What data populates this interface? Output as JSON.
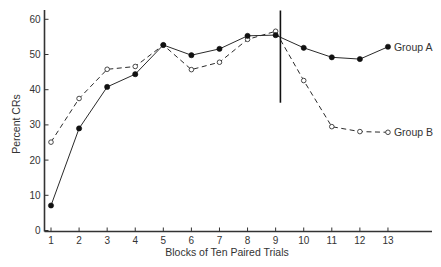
{
  "chart_data": {
    "type": "line",
    "title": "",
    "xlabel": "Blocks of Ten Paired Trials",
    "ylabel": "Percent CRs",
    "x": [
      1,
      2,
      3,
      4,
      5,
      6,
      7,
      8,
      9,
      10,
      11,
      12,
      13
    ],
    "xticks": [
      "1",
      "2",
      "3",
      "4",
      "5",
      "6",
      "7",
      "8",
      "9",
      "10",
      "11",
      "12",
      "13"
    ],
    "yticks": [
      "0",
      "10",
      "20",
      "30",
      "40",
      "50",
      "60"
    ],
    "ylim": [
      0,
      60
    ],
    "xlim": [
      0.7,
      14.6
    ],
    "grid": false,
    "legend_position": "inline-right",
    "series": [
      {
        "name": "Group A",
        "style": "solid",
        "marker": "filled-circle",
        "values": [
          7.1,
          29.0,
          40.8,
          44.4,
          52.7,
          49.8,
          51.6,
          55.3,
          55.5,
          51.9,
          49.2,
          48.7,
          52.2
        ]
      },
      {
        "name": "Group B",
        "style": "dashed",
        "marker": "open-circle",
        "values": [
          25.1,
          37.5,
          45.8,
          46.6,
          52.7,
          45.7,
          47.8,
          54.3,
          56.6,
          42.6,
          29.5,
          28.1,
          27.9
        ]
      }
    ],
    "annotations": [
      {
        "type": "vertical-line",
        "x": 9.17,
        "y_from": 36.3,
        "y_to": 62.5,
        "note": "marker separating blocks 9 and 10"
      }
    ]
  },
  "colors": {
    "axis": "#333333",
    "line": "#2a2a2a",
    "background": "#ffffff"
  }
}
